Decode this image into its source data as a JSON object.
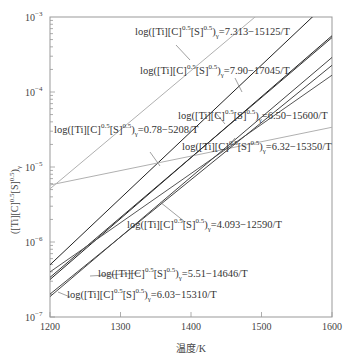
{
  "chart_data": {
    "type": "line",
    "title": "",
    "xlabel": "温度/K",
    "ylabel": "([Ti][C]^0.5[S]^0.5)_γ",
    "xlim": [
      1200,
      1600
    ],
    "ylim": [
      1e-07,
      0.001
    ],
    "yscale": "log",
    "grid": false,
    "legend": "inline annotations",
    "x_ticks": [
      "1200",
      "1300",
      "1400",
      "1500",
      "1600"
    ],
    "y_ticks": [
      "10^-7",
      "10^-6",
      "10^-5",
      "10^-4",
      "10^-3"
    ],
    "series": [
      {
        "name": "log([Ti][C]^0.5[S]^0.5)γ=7.313−15125/T",
        "A": 7.313,
        "B": 15125,
        "color": "#b0b0b0",
        "x": [
          1200,
          1600
        ],
        "log10_y": [
          -5.291,
          -2.14
        ]
      },
      {
        "name": "log([Ti][C]^0.5[S]^0.5)γ=7.90−17045/T",
        "A": 7.9,
        "B": 17045,
        "color": "#222222",
        "x": [
          1200,
          1600
        ],
        "log10_y": [
          -6.304,
          -2.753
        ]
      },
      {
        "name": "log([Ti][C]^0.5[S]^0.5)γ=6.50−15600/T",
        "A": 6.5,
        "B": 15600,
        "color": "#222222",
        "x": [
          1200,
          1600
        ],
        "log10_y": [
          -6.5,
          -3.25
        ]
      },
      {
        "name": "log([Ti][C]^0.5[S]^0.5)γ=0.78−5208/T",
        "A": 0.78,
        "B": 5208,
        "color": "#b0b0b0",
        "x": [
          1200,
          1600
        ],
        "log10_y": [
          -5.24,
          -4.47
        ]
      },
      {
        "name": "log([Ti][C]^0.5[S]^0.5)γ=6.32−15350/T",
        "A": 6.32,
        "B": 15350,
        "color": "#333333",
        "x": [
          1200,
          1600
        ],
        "log10_y": [
          -6.472,
          -3.274
        ]
      },
      {
        "name": "log([Ti][C]^0.5[S]^0.5)γ=4.093−12590/T",
        "A": 4.093,
        "B": 12590,
        "color": "#555555",
        "x": [
          1200,
          1600
        ],
        "log10_y": [
          -6.399,
          -3.776
        ]
      },
      {
        "name": "log([Ti][C]^0.5[S]^0.5)γ=5.51−14646/T",
        "A": 5.51,
        "B": 14646,
        "color": "#444444",
        "x": [
          1200,
          1600
        ],
        "log10_y": [
          -6.695,
          -3.644
        ]
      },
      {
        "name": "log([Ti][C]^0.5[S]^0.5)γ=6.03−15310/T",
        "A": 6.03,
        "B": 15310,
        "color": "#444444",
        "x": [
          1200,
          1600
        ],
        "log10_y": [
          -6.728,
          -3.539
        ]
      }
    ],
    "annotations": [
      {
        "prefix": "log([Ti][C]",
        "rest": "=7.313−15125/T"
      },
      {
        "prefix": "log([Ti][C]",
        "rest": "=7.90−17045/T"
      },
      {
        "prefix": "log([Ti][C]",
        "rest": "=6.50−15600/T"
      },
      {
        "prefix": "log([Ti][C]",
        "rest": "=0.78−5208/T"
      },
      {
        "prefix": "log([Ti][C]",
        "rest": "=6.32−15350/T"
      },
      {
        "prefix": "log([Ti][C]",
        "rest": "=4.093−12590/T"
      },
      {
        "prefix": "log([Ti][C]",
        "rest": "=5.51−14646/T"
      },
      {
        "prefix": "log([Ti][C]",
        "rest": "=6.03−15310/T"
      }
    ]
  },
  "labels": {
    "xlabel": "温度/K",
    "x_ticks": [
      "1200",
      "1300",
      "1400",
      "1500",
      "1600"
    ],
    "y_exp": [
      "−7",
      "−6",
      "−5",
      "−4",
      "−3"
    ]
  }
}
